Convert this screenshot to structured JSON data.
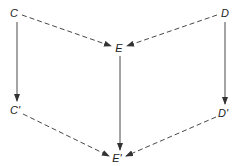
{
  "diagram": {
    "colors": {
      "stroke": "#333333",
      "text": "#222222",
      "background": "#ffffff"
    },
    "nodes": [
      {
        "id": "C",
        "label": "C",
        "x": 14,
        "y": 13
      },
      {
        "id": "D",
        "label": "D",
        "x": 225,
        "y": 13
      },
      {
        "id": "E",
        "label": "E",
        "x": 119,
        "y": 48
      },
      {
        "id": "Cp",
        "label": "C'",
        "x": 15,
        "y": 110
      },
      {
        "id": "Dp",
        "label": "D'",
        "x": 223,
        "y": 113
      },
      {
        "id": "Ep",
        "label": "E'",
        "x": 117,
        "y": 158
      }
    ],
    "edges": [
      {
        "from": "C",
        "to": "E",
        "style": "dashed"
      },
      {
        "from": "D",
        "to": "E",
        "style": "dashed"
      },
      {
        "from": "C",
        "to": "Cp",
        "style": "solid"
      },
      {
        "from": "E",
        "to": "Ep",
        "style": "solid"
      },
      {
        "from": "D",
        "to": "Dp",
        "style": "solid"
      },
      {
        "from": "Cp",
        "to": "Ep",
        "style": "dashed"
      },
      {
        "from": "Dp",
        "to": "Ep",
        "style": "dashed"
      }
    ]
  }
}
